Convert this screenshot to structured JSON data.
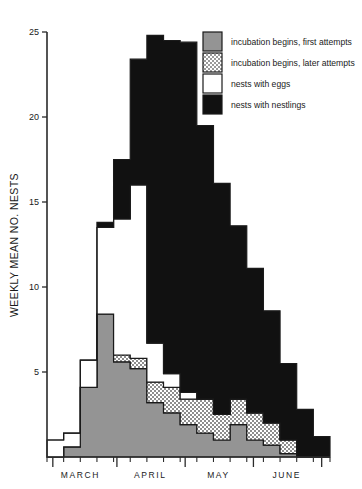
{
  "chart_data": {
    "type": "area",
    "title": "",
    "xlabel": "",
    "ylabel": "WEEKLY MEAN NO. NESTS",
    "ylim": [
      0,
      25
    ],
    "yticks": [
      5,
      10,
      15,
      20,
      25
    ],
    "ytick_labels": [
      "5",
      "10",
      "15",
      "20",
      "25"
    ],
    "grid": false,
    "legend_position": "top-right",
    "xlim": [
      0,
      17
    ],
    "x_month_labels": [
      "MARCH",
      "APRIL",
      "MAY",
      "JUNE"
    ],
    "x_month_centers": [
      2.0,
      6.2,
      10.3,
      14.4
    ],
    "x_month_boundaries": [
      0.35,
      4.2,
      8.3,
      12.4,
      16.5
    ],
    "x_minor_tick_step": 1.0,
    "stacking": "stacked-step",
    "series": [
      {
        "name": "incubation begins, first attempts",
        "fill": "#949494",
        "pattern": "solid-grey",
        "values": [
          0,
          0.6,
          4.1,
          8.4,
          5.6,
          5.2,
          3.2,
          2.6,
          1.9,
          1.4,
          1.0,
          1.9,
          1.0,
          0.7,
          0.2,
          0,
          0
        ]
      },
      {
        "name": "incubation begins, later attempts",
        "fill": "#cccccc",
        "pattern": "checker",
        "values": [
          0,
          0,
          0,
          0,
          0.4,
          0.6,
          1.2,
          1.5,
          1.5,
          2.0,
          1.5,
          1.5,
          1.6,
          1.3,
          0.8,
          0,
          0
        ]
      },
      {
        "name": "nests with eggs",
        "fill": "#ffffff",
        "pattern": "none",
        "values": [
          1.0,
          0.8,
          1.6,
          5.1,
          8.0,
          10.2,
          2.3,
          0.8,
          0.4,
          0,
          0,
          0,
          0,
          0,
          0,
          0,
          0
        ]
      },
      {
        "name": "nests with nestlings",
        "fill": "#111111",
        "pattern": "solid-black",
        "values": [
          0,
          0,
          0,
          0.3,
          3.5,
          7.4,
          18.1,
          19.6,
          20.6,
          16.1,
          13.6,
          10.2,
          8.5,
          6.6,
          4.5,
          2.8,
          1.2
        ]
      }
    ]
  },
  "legend": {
    "items": [
      {
        "label": "incubation begins, first attempts",
        "swatch": "solid-grey"
      },
      {
        "label": "incubation begins, later attempts",
        "swatch": "checker"
      },
      {
        "label": "nests with eggs",
        "swatch": "white"
      },
      {
        "label": "nests with nestlings",
        "swatch": "black"
      }
    ]
  },
  "colors": {
    "first_attempts": "#949494",
    "later_attempts": "#cccccc",
    "eggs": "#ffffff",
    "nestlings": "#111111",
    "axis": "#2b2b2b",
    "background": "#ffffff"
  }
}
